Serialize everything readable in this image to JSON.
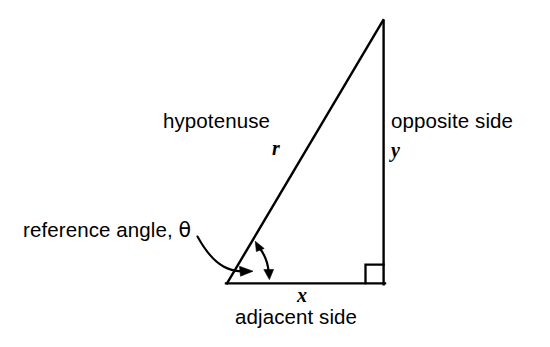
{
  "figure": {
    "kind": "right-triangle-trigonometry-diagram",
    "background_color": "#ffffff",
    "stroke_color": "#000000"
  },
  "labels": {
    "hypotenuse": "hypotenuse",
    "hypotenuse_var": "r",
    "opposite": "opposite side",
    "opposite_var": "y",
    "adjacent": "adjacent side",
    "adjacent_var": "x",
    "reference_angle": "reference angle, ",
    "theta": "θ"
  },
  "geometry": {
    "vertex_angle": {
      "x": 227,
      "y": 283
    },
    "vertex_right": {
      "x": 384,
      "y": 283
    },
    "vertex_apex": {
      "x": 383,
      "y": 20
    },
    "right_angle_marker_size": 18,
    "angle_arc_radius": 42,
    "stroke_width": 2.4
  }
}
